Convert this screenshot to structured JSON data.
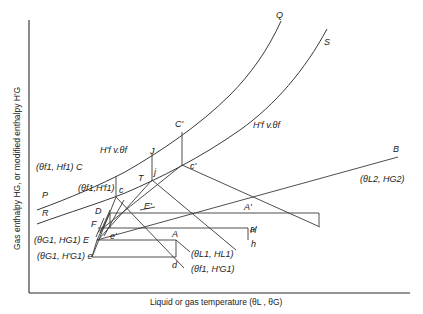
{
  "diagram": {
    "type": "enthalpy-temperature diagram (cooling tower / humidification)",
    "axes": {
      "x_label": "Liquid or gas temperature (θL , θG)",
      "y_label": "Gas enthalpy HG, or modified enthalpy H'G"
    },
    "curves": {
      "upper": {
        "start_label": "P",
        "end_label": "Q"
      },
      "lower": {
        "start_label": "R",
        "end_label": "S",
        "annotation": "H'f v.θf"
      },
      "upper_annotation": "H'f v.θf",
      "operating_line": {
        "end_label": "B",
        "end_coord": "(θL2, HG2)"
      }
    },
    "points": {
      "C": "(θf1, Hf1) C",
      "c": "(θf1,H'f1)",
      "c_letter": "c",
      "C_prime": "C'",
      "c_prime": "c'",
      "J": "J",
      "j": "j",
      "T": "T",
      "D": "D",
      "E_prime": "E'",
      "F": "F",
      "f": "f",
      "e_prime": "e'",
      "E": "(θG1, HG1) E",
      "e": "(θG1, H'G1) e",
      "A": "A",
      "d": "d",
      "A_prime": "A'",
      "a_prime": "a'",
      "H": "H",
      "h": "h",
      "L1": "(θL1, HL1)",
      "f1G1": "(θf1, H'G1)",
      "B": "B",
      "L2": "(θL2, HG2)"
    },
    "colors": {
      "line": "#3a3a3a",
      "background": "#ffffff",
      "text": "#222222"
    }
  }
}
